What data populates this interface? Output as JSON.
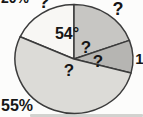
{
  "chart_data": {
    "type": "pie",
    "title": "",
    "legend": "none",
    "grid": false,
    "geometry": {
      "cx": 74,
      "cy": 59,
      "rx": 59,
      "ry": 54.5
    },
    "outline_color": "#3b3b3b",
    "slices": [
      {
        "name": "slice-white-54deg",
        "label": "54°",
        "value_degrees": 54,
        "start_deg": 90,
        "end_deg": 156,
        "color": "#f8f7f4"
      },
      {
        "name": "slice-top-right-unknown",
        "label": "?",
        "value_degrees": null,
        "start_deg": 20,
        "end_deg": 90,
        "color": "#c7c6c3"
      },
      {
        "name": "slice-right-dark",
        "label": "1",
        "value_degrees": null,
        "start_deg": -15,
        "end_deg": 20,
        "color": "#b6b5b2"
      },
      {
        "name": "slice-large-55pct",
        "label": "55%",
        "value_percent": 55,
        "start_deg": 156,
        "end_deg": 345,
        "color": "#dcdbd7"
      }
    ],
    "annotations_visible": [
      "20%",
      "?",
      "54°",
      "?",
      "?",
      "?",
      "?",
      "1",
      "55%"
    ]
  },
  "labels": [
    {
      "name": "label-topleft-cut-fragment",
      "text": "20%",
      "x": 15,
      "y": -2,
      "size": 14
    },
    {
      "name": "label-question-top-cut",
      "text": "?",
      "x": 44,
      "y": 1.5,
      "size": 18
    },
    {
      "name": "label-question-top-right",
      "text": "?",
      "x": 118,
      "y": 9,
      "size": 18
    },
    {
      "name": "label-54-degrees",
      "text": "54°",
      "x": 67,
      "y": 34,
      "size": 16
    },
    {
      "name": "label-question-slice-top-right",
      "text": "?",
      "x": 86,
      "y": 47,
      "size": 17
    },
    {
      "name": "label-question-slice-dark",
      "text": "?",
      "x": 98,
      "y": 61,
      "size": 17
    },
    {
      "name": "label-question-slice-large",
      "text": "?",
      "x": 69,
      "y": 70,
      "size": 17
    },
    {
      "name": "label-1-cut-right",
      "text": "1",
      "x": 139.5,
      "y": 58,
      "size": 15
    },
    {
      "name": "label-55-percent",
      "text": "55%",
      "x": 17,
      "y": 106,
      "size": 16
    }
  ]
}
